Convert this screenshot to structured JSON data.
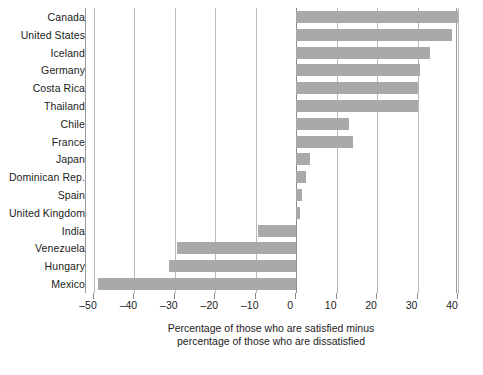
{
  "chart_data": {
    "type": "bar",
    "orientation": "horizontal",
    "title": "",
    "subtitle": "",
    "xlabel": "Percentage of those who are satisfied minus percentage of those who are dissatisfied",
    "ylabel": "",
    "xlim": [
      -50,
      40
    ],
    "xtick_step": 10,
    "grid": true,
    "legend": false,
    "bar_color": "#a9a9a9",
    "gridline_color": "#b9b9b9",
    "axis_color": "#8d8d8d",
    "background_color": "#ffffff",
    "xticks": [
      -50,
      -40,
      -30,
      -20,
      -10,
      0,
      10,
      20,
      30,
      40
    ],
    "xtick_labels": [
      "–50",
      "–40",
      "–30",
      "–20",
      "–10",
      "0",
      "10",
      "20",
      "30",
      "40"
    ],
    "categories": [
      "Canada",
      "United States",
      "Iceland",
      "Germany",
      "Costa Rica",
      "Thailand",
      "Chile",
      "France",
      "Japan",
      "Dominican Rep.",
      "Spain",
      "United Kingdom",
      "India",
      "Venezuela",
      "Hungary",
      "Mexico"
    ],
    "values": [
      40,
      38.5,
      33,
      30.5,
      30,
      30,
      13,
      14,
      3.5,
      2.5,
      1.5,
      1,
      -9.5,
      -29.5,
      -31.5,
      -49
    ]
  },
  "caption": {
    "line1": "Percentage of those who are satisfied minus",
    "line2": "percentage of those who are dissatisfied"
  }
}
